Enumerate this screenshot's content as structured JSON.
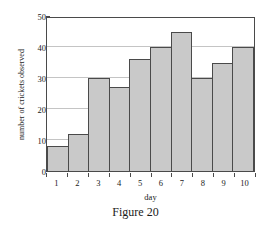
{
  "caption": "Figure 20",
  "chart_data": {
    "type": "bar",
    "title": "",
    "subtitle": "",
    "xlabel": "day",
    "ylabel": "number of crickets observed",
    "categories": [
      "1",
      "2",
      "3",
      "4",
      "5",
      "6",
      "7",
      "8",
      "9",
      "10"
    ],
    "values": [
      8,
      12,
      30,
      27,
      36,
      40,
      45,
      30,
      35,
      40
    ],
    "ylim": [
      0,
      50
    ],
    "yticks": [
      0,
      10,
      20,
      30,
      40,
      50
    ],
    "ytick_labels": [
      "0",
      "10",
      "20",
      "30",
      "40",
      "50"
    ],
    "grid": "horizontal",
    "legend": "none",
    "bar_fill_color": "#c9c9c9",
    "bar_edge_color": "#4a4a4a",
    "gridline_color": "#c4c4c4",
    "axis_color": "#4a4a4a",
    "background_color": "#ffffff",
    "annotations": []
  }
}
